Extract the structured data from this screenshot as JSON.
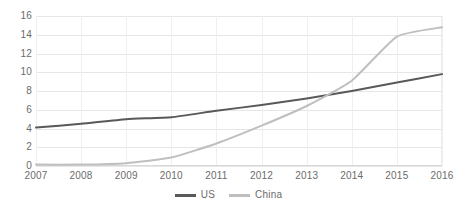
{
  "chart_data": {
    "type": "line",
    "title": "",
    "xlabel": "",
    "ylabel": "",
    "categories": [
      "2007",
      "2008",
      "2009",
      "2010",
      "2011",
      "2012",
      "2013",
      "2014",
      "2015",
      "2016"
    ],
    "series": [
      {
        "name": "US",
        "color": "#595959",
        "values": [
          4.1,
          4.5,
          5.0,
          5.2,
          5.9,
          6.5,
          7.2,
          8.0,
          8.9,
          9.8
        ]
      },
      {
        "name": "China",
        "color": "#bfbfbf",
        "values": [
          0.15,
          0.15,
          0.3,
          0.9,
          2.4,
          4.3,
          6.4,
          9.1,
          13.8,
          14.8
        ]
      }
    ],
    "ylim": [
      0,
      16
    ],
    "yticks": [
      0,
      2,
      4,
      6,
      8,
      10,
      12,
      14,
      16
    ],
    "ytick_labels": [
      "0",
      "2",
      "4",
      "6",
      "8",
      "10",
      "12",
      "14",
      "16"
    ],
    "grid": true,
    "grid_axis": "both",
    "legend_position": "bottom",
    "legend": [
      "US",
      "China"
    ]
  },
  "colors": {
    "gridline": "#e6e6e6",
    "vertical_gridline": "#efefef",
    "tick_label": "#6b6b6b",
    "background": "#ffffff",
    "us_line": "#595959",
    "china_line": "#bfbfbf"
  }
}
